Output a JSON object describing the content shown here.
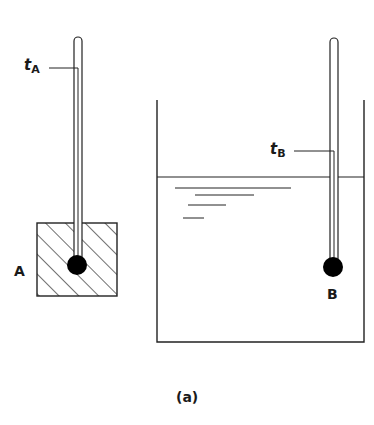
{
  "figure": {
    "caption": "(a)",
    "colors": {
      "ink": "#222222",
      "background": "#ffffff"
    }
  },
  "thermometer_a": {
    "label_main": "t",
    "label_sub": "A",
    "object_label": "A",
    "object": "hatched solid block"
  },
  "thermometer_b": {
    "label_main": "t",
    "label_sub": "B",
    "bulb_label": "B",
    "container": "beaker with liquid"
  }
}
